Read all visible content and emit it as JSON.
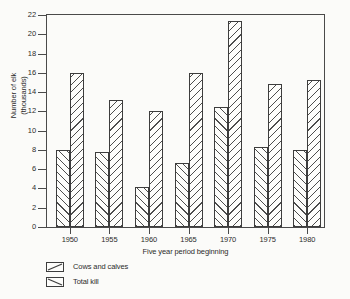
{
  "chart_data": {
    "type": "bar",
    "title": "",
    "xlabel": "Five year period beginning",
    "ylabel": "Number of elk\n(thousands)",
    "ylabel_line1": "Number of elk",
    "ylabel_line2": "(thousands)",
    "categories": [
      "1950",
      "1955",
      "1960",
      "1965",
      "1970",
      "1975",
      "1980"
    ],
    "series": [
      {
        "name": "Cows and calves",
        "hatch": "forward-slash",
        "values": [
          8.0,
          7.8,
          4.2,
          6.6,
          12.5,
          8.3,
          8.0
        ]
      },
      {
        "name": "Total kill",
        "hatch": "back-slash",
        "values": [
          16.0,
          13.2,
          12.0,
          16.0,
          21.4,
          14.8,
          15.3
        ]
      }
    ],
    "ylim": [
      0,
      22
    ],
    "ytick_step": 2,
    "yticks": [
      "0",
      "2",
      "4",
      "6",
      "8",
      "10",
      "12",
      "14",
      "16",
      "18",
      "20",
      "22"
    ],
    "grid": false,
    "legend_position": "below-axes-left",
    "frame": "full-box",
    "colors": {
      "line": "#3d3d3d",
      "text": "#2b2b2b",
      "background": "#fbfbf9",
      "bar_fill": "#fdfdfb"
    }
  }
}
